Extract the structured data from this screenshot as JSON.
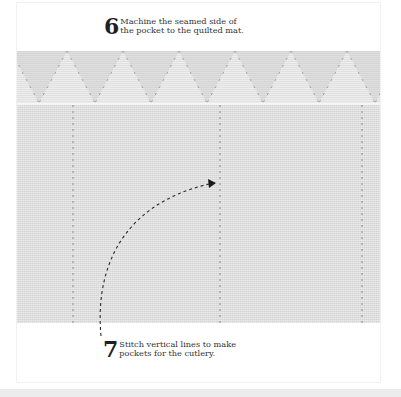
{
  "steps": [
    {
      "number": "6",
      "lines": [
        "Machine the seamed side of",
        "the pocket to the quilted mat."
      ]
    },
    {
      "number": "7",
      "lines": [
        "Stitch vertical lines to make",
        "pockets for the cutlery."
      ]
    }
  ],
  "photo": {
    "subject": "quilted-mat-with-stitched-pocket",
    "colors": {
      "fabric": "#e1e1e1",
      "quilt": "#e8e8e8",
      "stitch": "#8a8a8a",
      "arrow": "#2a2a2a"
    },
    "stitch_lines_x": [
      73,
      220,
      362
    ]
  }
}
